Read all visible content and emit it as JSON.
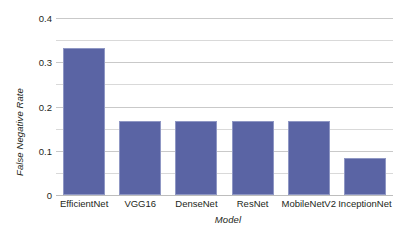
{
  "chart_data": {
    "type": "bar",
    "title": "",
    "xlabel": "Model",
    "ylabel": "False Negative Rate",
    "categories": [
      "EfficientNet",
      "VGG16",
      "DenseNet",
      "ResNet",
      "MobileNetV2",
      "InceptionNet"
    ],
    "values": [
      0.333,
      0.167,
      0.167,
      0.167,
      0.167,
      0.083
    ],
    "series": [
      {
        "name": "False Negative Rate",
        "values": [
          0.333,
          0.167,
          0.167,
          0.167,
          0.167,
          0.083
        ]
      }
    ],
    "ylim": [
      0,
      0.4
    ],
    "y_major_ticks": [
      0,
      0.1,
      0.2,
      0.3,
      0.4
    ],
    "y_major_tick_labels": [
      "0",
      "0.1",
      "0.2",
      "0.3",
      "0.4"
    ],
    "y_minor_ticks": [
      0.05,
      0.15,
      0.25,
      0.35
    ],
    "grid": true,
    "grid_axis": "y",
    "legend": false,
    "legend_position": "none",
    "bar_color": "#5a64a4",
    "bar_edge_color": "#8f97c4",
    "gridline_color": "#d9d9d9",
    "axis_color": "#bdbdbd",
    "background_color": "#ffffff",
    "text_color": "#231f20"
  }
}
